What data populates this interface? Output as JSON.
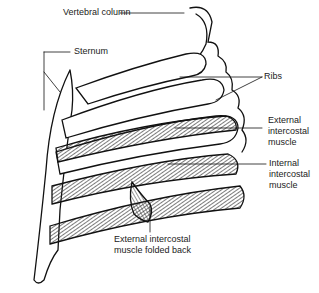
{
  "figure": {
    "labels": {
      "vertebral_column": "Vertebral column",
      "sternum": "Sternum",
      "ribs": "Ribs",
      "external_intercostal": [
        "External",
        "intercostal",
        "muscle"
      ],
      "internal_intercostal": [
        "Internal",
        "intercostal",
        "muscle"
      ],
      "folded_back": [
        "External intercostal",
        "muscle folded back"
      ]
    }
  }
}
